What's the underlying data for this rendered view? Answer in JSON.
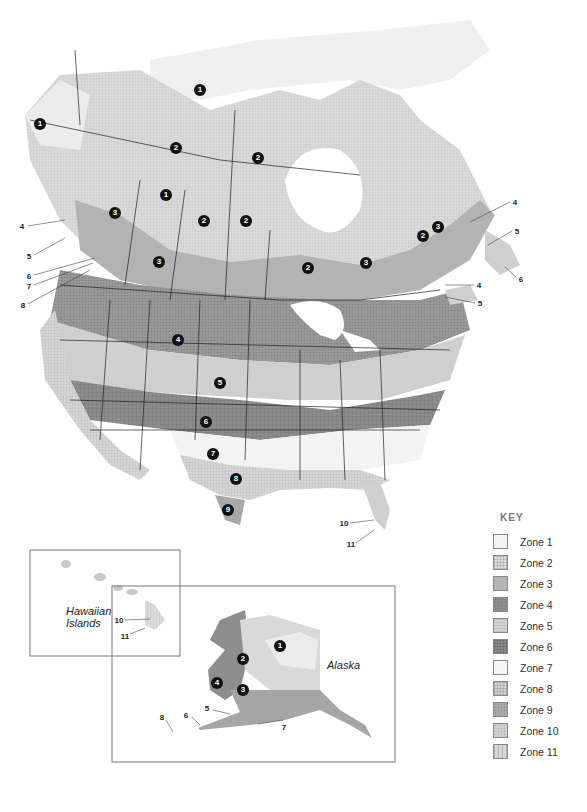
{
  "map": {
    "title": "Plant Hardiness Zones of North America",
    "insets": {
      "hawaii": {
        "label_line1": "Hawaiian",
        "label_line2": "Islands",
        "callouts": [
          "10",
          "11"
        ]
      },
      "alaska": {
        "label": "Alaska",
        "markers": [
          "1",
          "2",
          "3",
          "4"
        ],
        "callouts": [
          "5",
          "6",
          "7",
          "8"
        ]
      }
    },
    "mainland_markers": [
      {
        "zone": "1",
        "x": 40,
        "y": 124
      },
      {
        "zone": "1",
        "x": 200,
        "y": 90
      },
      {
        "zone": "2",
        "x": 176,
        "y": 148
      },
      {
        "zone": "2",
        "x": 258,
        "y": 158
      },
      {
        "zone": "1",
        "x": 166,
        "y": 195
      },
      {
        "zone": "3",
        "x": 115,
        "y": 213
      },
      {
        "zone": "2",
        "x": 204,
        "y": 221
      },
      {
        "zone": "2",
        "x": 246,
        "y": 221
      },
      {
        "zone": "2",
        "x": 423,
        "y": 236
      },
      {
        "zone": "3",
        "x": 438,
        "y": 227
      },
      {
        "zone": "3",
        "x": 159,
        "y": 262
      },
      {
        "zone": "2",
        "x": 308,
        "y": 268
      },
      {
        "zone": "3",
        "x": 366,
        "y": 263
      },
      {
        "zone": "4",
        "x": 178,
        "y": 340
      },
      {
        "zone": "5",
        "x": 220,
        "y": 383
      },
      {
        "zone": "6",
        "x": 206,
        "y": 422
      },
      {
        "zone": "7",
        "x": 213,
        "y": 454
      },
      {
        "zone": "8",
        "x": 236,
        "y": 479
      },
      {
        "zone": "9",
        "x": 228,
        "y": 510
      }
    ],
    "callouts": [
      {
        "label": "4",
        "x": 22,
        "y": 226
      },
      {
        "label": "5",
        "x": 29,
        "y": 256
      },
      {
        "label": "6",
        "x": 29,
        "y": 276
      },
      {
        "label": "7",
        "x": 29,
        "y": 286
      },
      {
        "label": "8",
        "x": 23,
        "y": 305
      },
      {
        "label": "4",
        "x": 515,
        "y": 202
      },
      {
        "label": "5",
        "x": 517,
        "y": 231
      },
      {
        "label": "6",
        "x": 521,
        "y": 279
      },
      {
        "label": "4",
        "x": 479,
        "y": 285
      },
      {
        "label": "5",
        "x": 480,
        "y": 303
      },
      {
        "label": "10",
        "x": 344,
        "y": 523
      },
      {
        "label": "11",
        "x": 351,
        "y": 544
      }
    ]
  },
  "legend": {
    "title": "KEY",
    "items": [
      {
        "label": "Zone 1",
        "color": "#f4f4f4",
        "pattern": "plain"
      },
      {
        "label": "Zone 2",
        "color": "#dcdcdc",
        "pattern": "grid"
      },
      {
        "label": "Zone 3",
        "color": "#b5b5b5",
        "pattern": "plain"
      },
      {
        "label": "Zone 4",
        "color": "#8e8e8e",
        "pattern": "dots"
      },
      {
        "label": "Zone 5",
        "color": "#d2d2d2",
        "pattern": "hlines"
      },
      {
        "label": "Zone 6",
        "color": "#8a8a8a",
        "pattern": "grid"
      },
      {
        "label": "Zone 7",
        "color": "#f6f6f6",
        "pattern": "plain"
      },
      {
        "label": "Zone 8",
        "color": "#d0d0d0",
        "pattern": "grid"
      },
      {
        "label": "Zone 9",
        "color": "#a8a8a8",
        "pattern": "dots"
      },
      {
        "label": "Zone 10",
        "color": "#cfcfcf",
        "pattern": "dots"
      },
      {
        "label": "Zone 11",
        "color": "#d8d8d8",
        "pattern": "vlines"
      }
    ]
  }
}
